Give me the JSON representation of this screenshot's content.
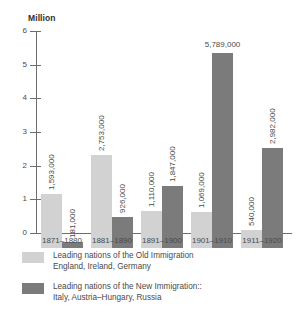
{
  "chart_data": {
    "type": "bar",
    "title": "",
    "ylabel": "Million",
    "xlabel": "",
    "ylim": [
      0,
      6
    ],
    "grid": false,
    "legend_position": "below",
    "y_ticks": [
      "0",
      "1",
      "2",
      "3",
      "4",
      "5",
      "6"
    ],
    "categories": [
      "1871–1880",
      "1881–1890",
      "1891–1900",
      "1901–1910",
      "1911–1920"
    ],
    "series": [
      {
        "name": "Old Immigration",
        "color": "#d2d2d2",
        "values": [
          1593000,
          2753000,
          1110000,
          1069000,
          540000
        ],
        "labels": [
          "1,593,000",
          "2,753,000",
          "1,110,000",
          "1,069,000",
          "540,000"
        ]
      },
      {
        "name": "New Immigration",
        "color": "#7b7b7b",
        "values": [
          181000,
          926000,
          1847000,
          5789000,
          2982000
        ],
        "labels": [
          "181,000",
          "926,000",
          "1,847,000",
          "5,789,000",
          "2,982,000"
        ]
      }
    ]
  },
  "legend": {
    "items": [
      {
        "swatch": "old",
        "line1": "Leading nations of the Old Immigration",
        "line2": "England, Ireland, Germany"
      },
      {
        "swatch": "new",
        "line1": "Leading nations of the New Immigration::",
        "line2": "Italy, Austria–Hungary, Russia"
      }
    ]
  }
}
